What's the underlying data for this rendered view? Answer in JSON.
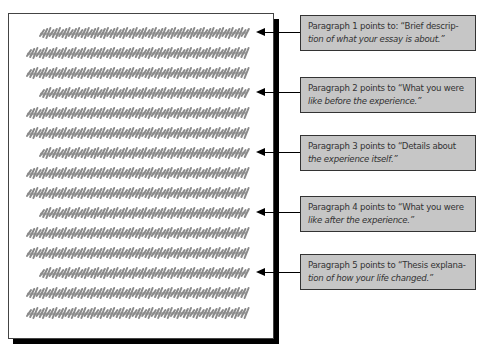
{
  "diagram": {
    "document": {
      "line_count": 15,
      "line_color": "#8a8a8a",
      "paragraph_start_lines": [
        1,
        4,
        7,
        10,
        13
      ]
    },
    "callouts": [
      {
        "paragraph": 1,
        "text": "Paragraph 1 points to: “Brief description of what your essay is about.”",
        "line1": "Paragraph 1 points to: “Brief descrip-",
        "line2": "tion of what your essay is about.”"
      },
      {
        "paragraph": 2,
        "text": "Paragraph 2 points to “What you were like before the experience.”",
        "line1": "Paragraph 2 points to “What you were",
        "line2": "like before the experience.”"
      },
      {
        "paragraph": 3,
        "text": "Paragraph 3 points to “Details about the experience itself.”",
        "line1": "Paragraph 3 points to “Details about",
        "line2": "the experience itself.”"
      },
      {
        "paragraph": 4,
        "text": "Paragraph 4 points to “What you were like after the experience.”",
        "line1": "Paragraph 4 points to “What you were",
        "line2": "like after the experience.”"
      },
      {
        "paragraph": 5,
        "text": "Paragraph 5 points to “Thesis explanation of how your life changed.”",
        "line1": "Paragraph 5 points to “Thesis explana-",
        "line2": "tion of how your life changed.”"
      }
    ],
    "colors": {
      "box_fill": "#c6c6c6",
      "box_border": "#333333",
      "arrow": "#000000"
    }
  }
}
